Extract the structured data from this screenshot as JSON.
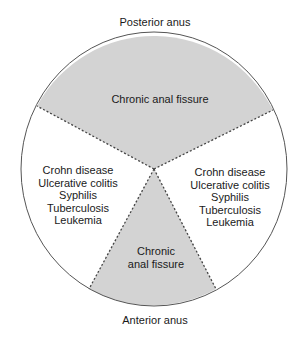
{
  "diagram": {
    "title_top": "Posterior anus",
    "title_bottom": "Anterior anus",
    "colors": {
      "shaded_region": "#d3d3d3",
      "outline": "#555555",
      "divider": "#444444",
      "text": "#1a1a1a",
      "background": "#ffffff"
    },
    "regions": [
      {
        "id": "posterior",
        "shaded": true,
        "label": "Chronic anal fissure"
      },
      {
        "id": "left-lateral",
        "shaded": false,
        "items": [
          "Crohn disease",
          "Ulcerative colitis",
          "Syphilis",
          "Tuberculosis",
          "Leukemia"
        ]
      },
      {
        "id": "right-lateral",
        "shaded": false,
        "items": [
          "Crohn disease",
          "Ulcerative colitis",
          "Syphilis",
          "Tuberculosis",
          "Leukemia"
        ]
      },
      {
        "id": "anterior",
        "shaded": true,
        "label_lines": [
          "Chronic",
          "anal fissure"
        ]
      }
    ]
  }
}
